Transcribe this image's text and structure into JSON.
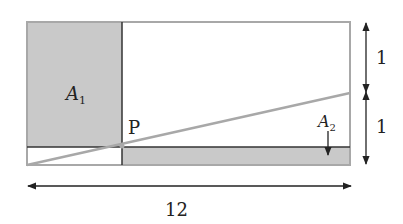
{
  "diagram": {
    "type": "geometry-figure",
    "labels": {
      "region_a1": "A",
      "region_a1_sub": "1",
      "region_a2": "A",
      "region_a2_sub": "2",
      "point_p": "P",
      "dim_top": "1",
      "dim_bottom": "1",
      "dim_width": "12"
    },
    "colors": {
      "shade": "#c9c9c9",
      "border": "#a8a8a8",
      "line": "#222222",
      "diagonal": "#a8a8a8"
    }
  }
}
